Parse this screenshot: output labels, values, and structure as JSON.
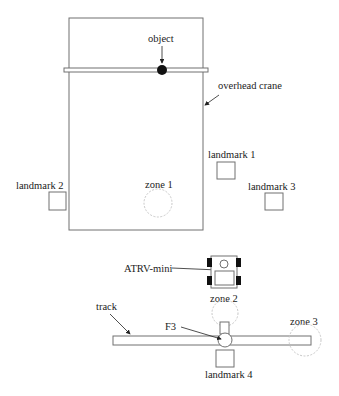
{
  "diagram": {
    "type": "workspace-layout",
    "colors": {
      "stroke": "#707070",
      "dark": "#111111",
      "zone": "#c8c8c8",
      "text": "#222222"
    },
    "labels": {
      "object": "object",
      "overhead_crane": "overhead crane",
      "landmark_1": "landmark 1",
      "landmark_2": "landmark 2",
      "landmark_3": "landmark 3",
      "landmark_4": "landmark 4",
      "zone_1": "zone 1",
      "zone_2": "zone 2",
      "zone_3": "zone 3",
      "robot": "ATRV-mini",
      "track": "track",
      "f3": "F3"
    },
    "elements": [
      {
        "id": "overhead-crane-area",
        "kind": "rectangle",
        "x": 69,
        "y": 18,
        "w": 134,
        "h": 212
      },
      {
        "id": "crane-rail",
        "kind": "bar",
        "x": 64,
        "y": 68,
        "w": 144,
        "h": 4
      },
      {
        "id": "object",
        "kind": "disc",
        "cx": 162,
        "cy": 70,
        "r": 5
      },
      {
        "id": "landmark-1",
        "kind": "box",
        "x": 217,
        "y": 162,
        "w": 18,
        "h": 17
      },
      {
        "id": "landmark-2",
        "kind": "box",
        "x": 49,
        "y": 192,
        "w": 17,
        "h": 18
      },
      {
        "id": "landmark-3",
        "kind": "box",
        "x": 265,
        "y": 193,
        "w": 18,
        "h": 17
      },
      {
        "id": "landmark-4",
        "kind": "box",
        "x": 216,
        "y": 350,
        "w": 18,
        "h": 17
      },
      {
        "id": "zone-1",
        "kind": "dashed-circle",
        "cx": 158,
        "cy": 203,
        "r": 14
      },
      {
        "id": "zone-2",
        "kind": "dashed-circle",
        "cx": 225,
        "cy": 313,
        "r": 13
      },
      {
        "id": "zone-3",
        "kind": "dashed-circle",
        "cx": 305,
        "cy": 340,
        "r": 16
      },
      {
        "id": "robot-atrv-mini",
        "kind": "robot",
        "x": 211,
        "y": 256,
        "w": 26,
        "h": 32
      },
      {
        "id": "track",
        "kind": "bar",
        "x": 113,
        "y": 336,
        "w": 198,
        "h": 9
      },
      {
        "id": "f3-turntable",
        "kind": "circle",
        "cx": 225,
        "cy": 340,
        "r": 7
      }
    ]
  }
}
